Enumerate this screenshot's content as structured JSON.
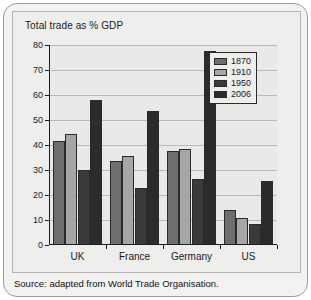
{
  "figure": {
    "title": "Total trade as % GDP",
    "source": "Source: adapted from World Trade Organisation."
  },
  "chart_data": {
    "type": "bar",
    "title": "Total trade as % GDP",
    "xlabel": "",
    "ylabel": "",
    "ylim": [
      0,
      80
    ],
    "yticks": [
      0,
      10,
      20,
      30,
      40,
      50,
      60,
      70,
      80
    ],
    "grid": true,
    "legend_position": "top-right",
    "categories": [
      "UK",
      "France",
      "Germany",
      "US"
    ],
    "series": [
      {
        "name": "1870",
        "color": "#6e6e6e",
        "values": [
          41.5,
          33.5,
          37.5,
          14.0
        ]
      },
      {
        "name": "1910",
        "color": "#a6a6a6",
        "values": [
          44.5,
          35.5,
          38.5,
          11.0
        ]
      },
      {
        "name": "1950",
        "color": "#3a3a3a",
        "values": [
          30.0,
          23.0,
          26.5,
          8.5
        ]
      },
      {
        "name": "2006",
        "color": "#2b2b2b",
        "values": [
          58.0,
          53.5,
          77.5,
          25.5
        ]
      }
    ]
  }
}
